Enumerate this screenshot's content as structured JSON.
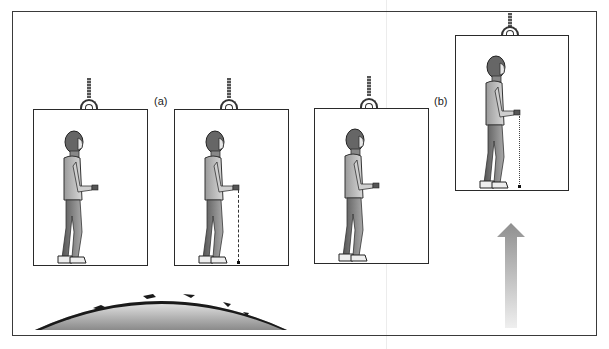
{
  "figure": {
    "labels": {
      "a": "(a)",
      "b": "(b)"
    },
    "panels": [
      {
        "id": "elevator-1",
        "group": "a",
        "state": "at rest, person standing",
        "ball_drop": "none"
      },
      {
        "id": "elevator-2",
        "group": "a",
        "state": "at rest, ball dropped straight down",
        "ball_drop": "dashed"
      },
      {
        "id": "elevator-3",
        "group": "b",
        "state": "accelerating, person standing",
        "ball_drop": "none"
      },
      {
        "id": "elevator-4",
        "group": "b",
        "state": "accelerating upward, ball dropped",
        "ball_drop": "dotted"
      }
    ],
    "icons": {
      "earth": "earth-surface-dome",
      "arrow": "up-arrow-acceleration",
      "rope": "cable-rope",
      "hook": "ring-hook"
    },
    "colors": {
      "line": "#2a2a2a",
      "earth_dark": "#1a1a1a",
      "earth_fill_top": "#e8e8e8",
      "earth_fill_bottom": "#8a8a8a",
      "arrow_top": "#8f8f8f",
      "arrow_bottom": "#efefef"
    }
  }
}
